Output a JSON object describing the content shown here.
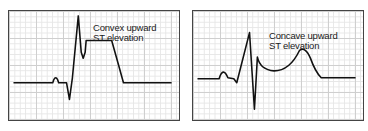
{
  "panels": [
    {
      "id": "left",
      "label_line1": "Convex upward",
      "label_line2": "ST elevation",
      "trace_color": "#111111",
      "grid_color": "#cfcfcf"
    },
    {
      "id": "right",
      "label_line1": "Concave upward",
      "label_line2": "ST elevation",
      "trace_color": "#111111",
      "grid_color": "#cfcfcf"
    }
  ]
}
